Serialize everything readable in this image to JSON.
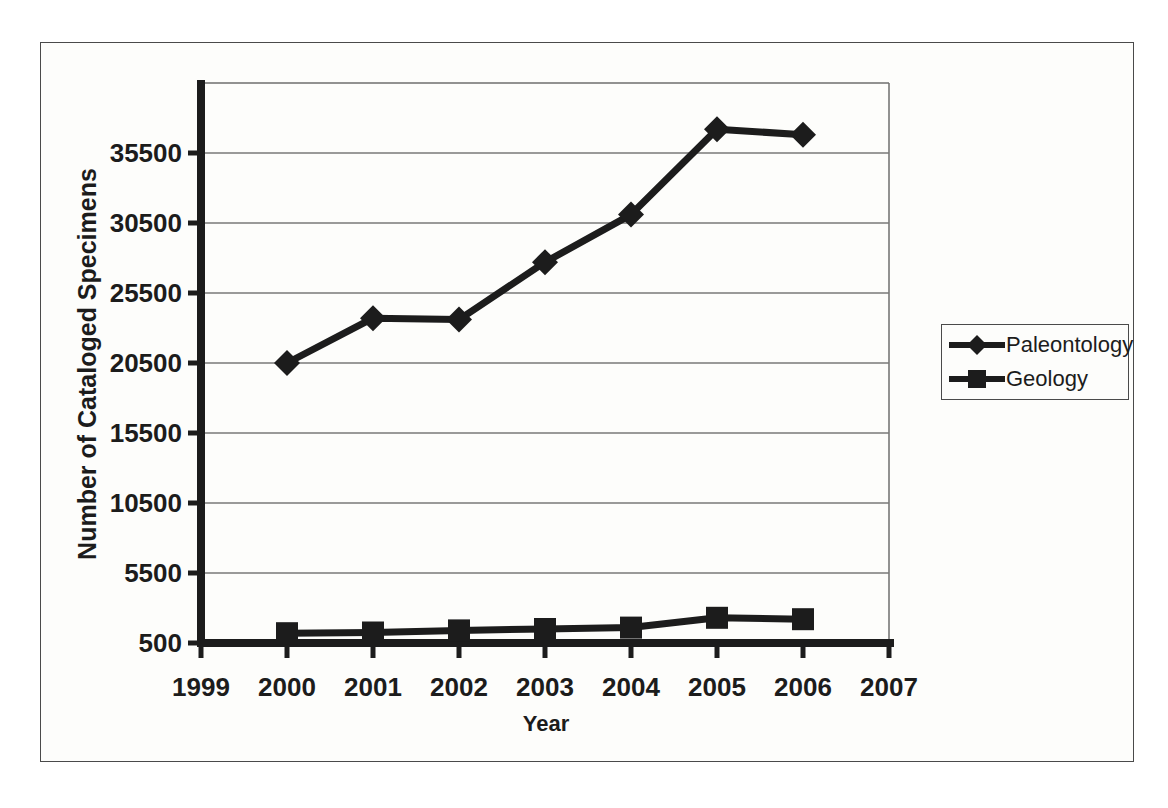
{
  "figure": {
    "background": "#fdfdfb",
    "border_color": "#4a4a4a",
    "ink_color": "#1c1c1c",
    "gridline_color": "#787878"
  },
  "chart_data": {
    "type": "line",
    "title": "",
    "xlabel": "Year",
    "ylabel": "Number of Cataloged Specimens",
    "xlim": [
      1999,
      2007
    ],
    "ylim": [
      500,
      40500
    ],
    "x_ticks": [
      "1999",
      "2000",
      "2001",
      "2002",
      "2003",
      "2004",
      "2005",
      "2006",
      "2007"
    ],
    "y_ticks": [
      "500",
      "5500",
      "10500",
      "15500",
      "20500",
      "25500",
      "30500",
      "35500"
    ],
    "grid": "horizontal",
    "legend_position": "right",
    "line_color": "#1c1c1c",
    "series": [
      {
        "name": "Paleontology",
        "marker": "diamond",
        "x": [
          2000,
          2001,
          2002,
          2003,
          2004,
          2005,
          2006
        ],
        "values": [
          20500,
          23700,
          23600,
          27700,
          31100,
          37200,
          36800
        ]
      },
      {
        "name": "Geology",
        "marker": "square",
        "x": [
          2000,
          2001,
          2002,
          2003,
          2004,
          2005,
          2006
        ],
        "values": [
          1200,
          1250,
          1400,
          1500,
          1600,
          2300,
          2200
        ]
      }
    ]
  }
}
